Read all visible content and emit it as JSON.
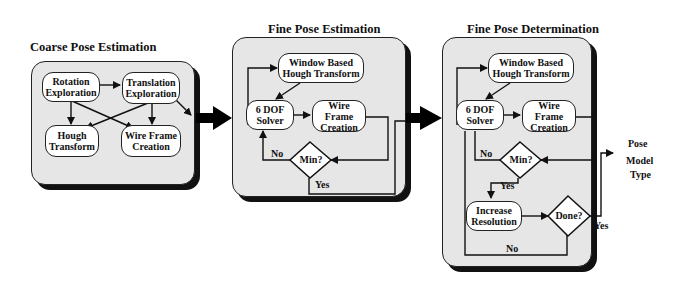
{
  "panels": [
    {
      "title": "Coarse Pose Estimation",
      "nodes": {
        "rotation": "Rotation Exploration",
        "translation": "Translation Exploration",
        "hough": "Hough Transform",
        "wireframe": "Wire Frame Creation"
      }
    },
    {
      "title": "Fine Pose Estimation",
      "nodes": {
        "window_hough": "Window Based Hough Transform",
        "solver": "6 DOF Solver",
        "wireframe": "Wire Frame Creation",
        "min": "Min?"
      },
      "labels": {
        "no": "No",
        "yes": "Yes"
      }
    },
    {
      "title": "Fine Pose Determination",
      "nodes": {
        "window_hough": "Window Based Hough Transform",
        "solver": "6 DOF Solver",
        "wireframe": "Wire Frame Creation",
        "min": "Min?",
        "increase": "Increase Resolution",
        "done": "Done?"
      },
      "labels": {
        "no_min": "No",
        "yes_min": "Yes",
        "yes_done": "Yes",
        "no_done": "No"
      }
    }
  ],
  "output_label": {
    "line1": "Pose",
    "line2": "Model",
    "line3": "Type"
  },
  "colors": {
    "panel_fill": "#e6e6e6",
    "node_fill": "#ffffff",
    "stroke": "#222222",
    "shadow": "#111111"
  }
}
